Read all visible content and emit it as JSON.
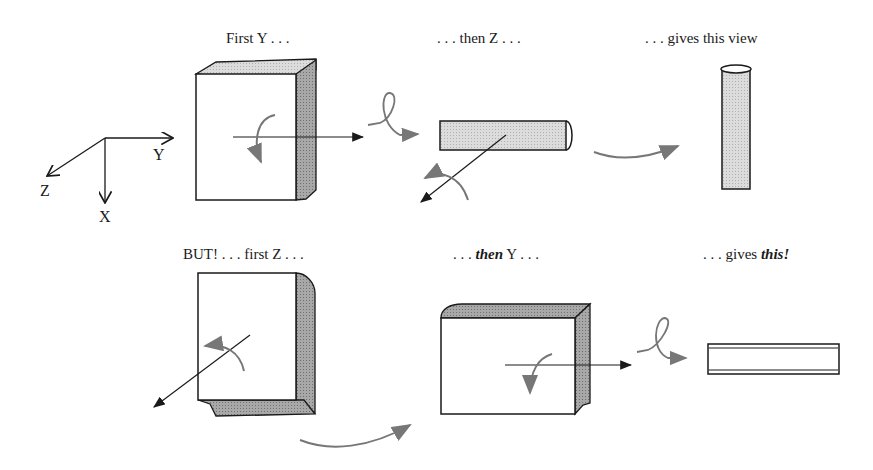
{
  "diagram": {
    "axes": {
      "x_label": "X",
      "y_label": "Y",
      "z_label": "Z"
    },
    "row1": {
      "step1": "First Y . . .",
      "step2": ". . . then Z . . .",
      "result": ". . . gives this view"
    },
    "row2": {
      "step1": "BUT! . . . first Z . . .",
      "step2_prefix": ". . . ",
      "step2_em": "then",
      "step2_suffix": " Y . . .",
      "result_prefix": ". . . gives ",
      "result_em": "this!"
    },
    "colors": {
      "ink": "#1a1a1a",
      "arrow_gray": "#777777",
      "shade_light": "#d4d4d4",
      "shade_dark": "#9a9a9a"
    }
  }
}
